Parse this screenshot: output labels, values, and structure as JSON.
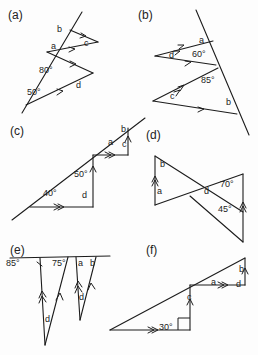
{
  "worksheet": {
    "title": "Parallel lines and triangles angle exercises",
    "panel_count": 6
  },
  "panels": [
    {
      "id": "a",
      "label": "(a)",
      "description": "Transversal line crossing two parallel segments forming two triangles",
      "angles": [
        "80°",
        "50°"
      ],
      "unknowns": [
        "b",
        "a",
        "c",
        "d"
      ],
      "marks": "single-arrow",
      "labels": [
        {
          "text": "b",
          "x": 57,
          "y": 29
        },
        {
          "text": "a",
          "x": 51,
          "y": 46
        },
        {
          "text": "c",
          "x": 84,
          "y": 42
        },
        {
          "text": "80°",
          "x": 43,
          "y": 70
        },
        {
          "text": "d",
          "x": 76,
          "y": 85
        },
        {
          "text": "50°",
          "x": 31,
          "y": 92
        }
      ]
    },
    {
      "id": "b",
      "label": "(b)",
      "description": "Transversal line crossing two parallel segments forming two triangles",
      "angles": [
        "60°",
        "85°"
      ],
      "unknowns": [
        "a",
        "d",
        "c",
        "b"
      ],
      "marks": "double-arrow-and-single",
      "labels": [
        {
          "text": "a",
          "x": 199,
          "y": 40
        },
        {
          "text": "d",
          "x": 171,
          "y": 54
        },
        {
          "text": "60°",
          "x": 196,
          "y": 53
        },
        {
          "text": "85°",
          "x": 204,
          "y": 80
        },
        {
          "text": "c",
          "x": 170,
          "y": 95
        },
        {
          "text": "b",
          "x": 226,
          "y": 101
        }
      ]
    },
    {
      "id": "c",
      "label": "(c)",
      "description": "Long transversal with two step right-angle triangles, double arrow marks",
      "angles": [
        "50°",
        "40°"
      ],
      "unknowns": [
        "b",
        "a",
        "c",
        "d"
      ],
      "marks": "double-arrow",
      "labels": [
        {
          "text": "b",
          "x": 121,
          "y": 128
        },
        {
          "text": "a",
          "x": 110,
          "y": 141
        },
        {
          "text": "c",
          "x": 122,
          "y": 143
        },
        {
          "text": "50°",
          "x": 78,
          "y": 174
        },
        {
          "text": "40°",
          "x": 47,
          "y": 193
        },
        {
          "text": "d",
          "x": 82,
          "y": 194
        }
      ]
    },
    {
      "id": "d",
      "label": "(d)",
      "description": "Two triangles crossing at a point with parallel vertical sides",
      "angles": [
        "70°",
        "45°"
      ],
      "unknowns": [
        "b",
        "a",
        "d"
      ],
      "marks": "double-arrow",
      "labels": [
        {
          "text": "b",
          "x": 160,
          "y": 163
        },
        {
          "text": "a",
          "x": 157,
          "y": 190
        },
        {
          "text": "d",
          "x": 204,
          "y": 190
        },
        {
          "text": "70°",
          "x": 225,
          "y": 184
        },
        {
          "text": "45°",
          "x": 223,
          "y": 209
        }
      ]
    },
    {
      "id": "e",
      "label": "(e)",
      "description": "Horizontal line with downward zig-zag triangles, parallel arrow marks",
      "angles": [
        "85°",
        "75°"
      ],
      "unknowns": [
        "a",
        "b",
        "d",
        "d"
      ],
      "marks": "double-arrow-and-single",
      "labels": [
        {
          "text": "85°",
          "x": 8,
          "y": 262
        },
        {
          "text": "75°",
          "x": 54,
          "y": 262
        },
        {
          "text": "a",
          "x": 78,
          "y": 262
        },
        {
          "text": "b",
          "x": 90,
          "y": 262
        },
        {
          "text": "d",
          "x": 79,
          "y": 296
        },
        {
          "text": "d",
          "x": 45,
          "y": 318
        }
      ]
    },
    {
      "id": "f",
      "label": "(f)",
      "description": "Right-angled triangle with step and 30 degree angle, double arrow parallels",
      "angles": [
        "30°"
      ],
      "unknowns": [
        "a",
        "b",
        "c",
        "d"
      ],
      "marks": "double-arrow",
      "labels": [
        {
          "text": "b",
          "x": 239,
          "y": 268
        },
        {
          "text": "a",
          "x": 213,
          "y": 281
        },
        {
          "text": "d",
          "x": 238,
          "y": 283
        },
        {
          "text": "c",
          "x": 189,
          "y": 296
        },
        {
          "text": "30°",
          "x": 163,
          "y": 327
        }
      ]
    }
  ]
}
